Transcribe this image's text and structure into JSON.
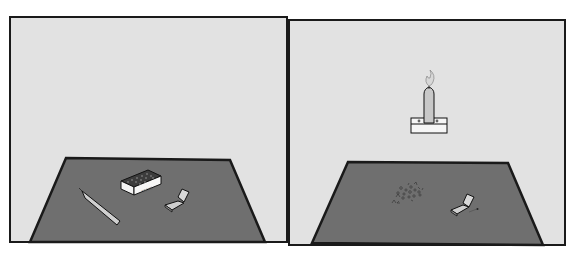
{
  "figure": {
    "colors": {
      "background": "#ffffff",
      "wall": "#e2e2e2",
      "table": "#6f6f6f",
      "outline": "#1a1a1a",
      "box_white": "#f4f4f4",
      "candle": "#c8c8c8",
      "flame": "#d8d8d8",
      "tacks": "#4a4a4a"
    },
    "panels": [
      {
        "id": "before",
        "objects": [
          {
            "name": "box-of-tacks",
            "label": "TACKS"
          },
          {
            "name": "candle"
          },
          {
            "name": "matchbook"
          }
        ]
      },
      {
        "id": "after",
        "objects": [
          {
            "name": "candle-on-box-mounted-to-wall"
          },
          {
            "name": "scattered-tacks"
          },
          {
            "name": "matchbook"
          },
          {
            "name": "burnt-match"
          }
        ]
      }
    ]
  }
}
